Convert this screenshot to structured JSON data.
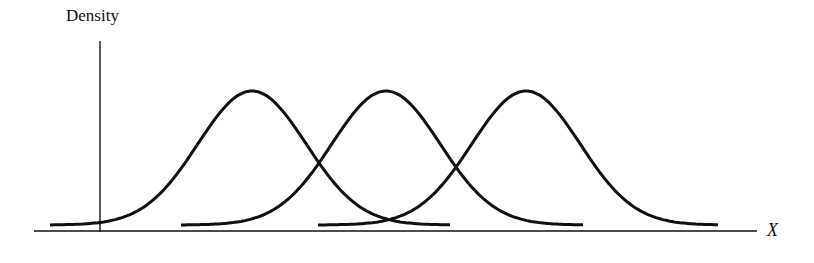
{
  "chart_data": {
    "type": "line",
    "title": "",
    "xlabel": "X",
    "ylabel": "Density",
    "grid": false,
    "legend": null,
    "series": [
      {
        "name": "Group 1",
        "mean_px": 252,
        "sd_px": 54,
        "x_start_px": 50,
        "x_end_px": 451
      },
      {
        "name": "Group 2",
        "mean_px": 386,
        "sd_px": 54,
        "x_start_px": 181,
        "x_end_px": 584
      },
      {
        "name": "Group 3",
        "mean_px": 526,
        "sd_px": 54,
        "x_start_px": 318,
        "x_end_px": 719
      }
    ],
    "axes": {
      "x_axis": {
        "x1": 34,
        "x2": 757,
        "y": 231
      },
      "y_axis": {
        "x": 100,
        "y1": 41,
        "y2": 232
      }
    },
    "curve_geometry": {
      "peak_y_px": 91,
      "baseline_y_px": 225
    }
  },
  "labels": {
    "y_axis_label": "Density",
    "x_axis_label": "X"
  }
}
